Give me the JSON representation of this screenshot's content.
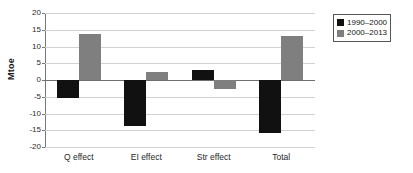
{
  "chart_data": {
    "type": "bar",
    "title": "",
    "xlabel": "",
    "ylabel": "Mtoe",
    "ylim": [
      -20,
      20
    ],
    "ytick_step": 5,
    "yticks": [
      20,
      15,
      10,
      5,
      0,
      -5,
      -10,
      -15,
      -20
    ],
    "ytick_labels": [
      "20",
      "15",
      "10",
      "5",
      "0",
      "-5",
      "-10",
      "-15",
      "-20"
    ],
    "categories": [
      "Q effect",
      "EI effect",
      "Str effect",
      "Total"
    ],
    "grid": true,
    "legend_position": "top-right",
    "series": [
      {
        "name": "1990–2000",
        "color": "#111111",
        "values": [
          -5.5,
          -13.8,
          3.1,
          -15.9
        ]
      },
      {
        "name": "2000–2013",
        "color": "#7f7f7f",
        "values": [
          13.8,
          2.3,
          -2.8,
          13.2
        ]
      }
    ]
  },
  "legend": {
    "items": [
      {
        "label": "1990–2000",
        "swatch": "black-square-icon"
      },
      {
        "label": "2000–2013",
        "swatch": "gray-square-icon"
      }
    ]
  }
}
